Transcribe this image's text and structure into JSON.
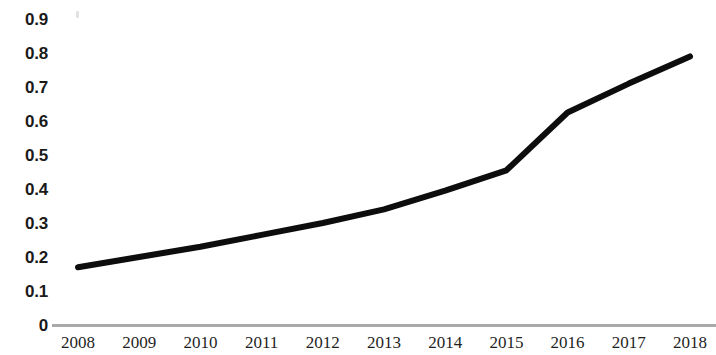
{
  "chart_data": {
    "type": "line",
    "title": "",
    "subtitle": "",
    "xlabel": "",
    "ylabel": "",
    "categories": [
      "2008",
      "2009",
      "2010",
      "2011",
      "2012",
      "2013",
      "2014",
      "2015",
      "2016",
      "2017",
      "2018"
    ],
    "x": [
      2008,
      2009,
      2010,
      2011,
      2012,
      2013,
      2014,
      2015,
      2016,
      2017,
      2018
    ],
    "values": [
      0.17,
      0.2,
      0.23,
      0.265,
      0.3,
      0.34,
      0.395,
      0.455,
      0.625,
      0.71,
      0.79
    ],
    "series": [
      {
        "name": "",
        "values": [
          0.17,
          0.2,
          0.23,
          0.265,
          0.3,
          0.34,
          0.395,
          0.455,
          0.625,
          0.71,
          0.79
        ],
        "color": "#0d0d0d",
        "line_width": 6,
        "markers": false
      }
    ],
    "ylim": [
      0,
      0.9
    ],
    "xlim": [
      2008,
      2018
    ],
    "y_ticks": [
      0,
      0.1,
      0.2,
      0.3,
      0.4,
      0.5,
      0.6,
      0.7,
      0.8,
      0.9
    ],
    "y_tick_labels": [
      "0",
      "0.1",
      "0.2",
      "0.3",
      "0.4",
      "0.5",
      "0.6",
      "0.7",
      "0.8",
      "0.9"
    ],
    "x_tick_labels": [
      "2008",
      "2009",
      "2010",
      "2011",
      "2012",
      "2013",
      "2014",
      "2015",
      "2016",
      "2017",
      "2018"
    ],
    "grid": false,
    "legend": null,
    "legend_position": "none",
    "annotations": [],
    "axis_line_color": "#a9a9a9",
    "background_color": "#ffffff",
    "text_color": "#1a1a1a"
  },
  "axes": {
    "y": {
      "labels": [
        "0.9",
        "0.8",
        "0.7",
        "0.6",
        "0.5",
        "0.4",
        "0.3",
        "0.2",
        "0.1",
        "0"
      ]
    },
    "x": {
      "labels": [
        "2008",
        "2009",
        "2010",
        "2011",
        "2012",
        "2013",
        "2014",
        "2015",
        "2016",
        "2017",
        "2018"
      ]
    }
  }
}
